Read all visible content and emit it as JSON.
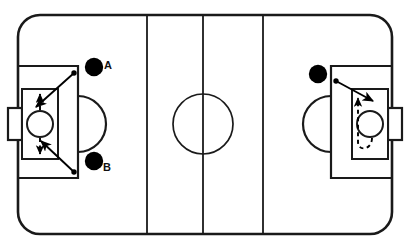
{
  "diagram": {
    "type": "ice-hockey-rink-play-diagram",
    "colors": {
      "ice": "#ffffff",
      "lines": "#1a1a1a",
      "player_fill": "#000000",
      "arrow": "#000000"
    },
    "rink": {
      "left": 18,
      "top": 15,
      "width": 374,
      "height": 219,
      "corner_radius": 22,
      "border_width": 2.6
    },
    "lines": [
      {
        "name": "blue-line-left",
        "x": 147,
        "label": "blue line"
      },
      {
        "name": "center-line",
        "x": 203,
        "label": "center red line"
      },
      {
        "name": "blue-line-right",
        "x": 263,
        "label": "blue line"
      }
    ],
    "center_circle": {
      "cx": 203,
      "cy": 124,
      "r": 30
    },
    "zones": {
      "left": {
        "goal_line_x": 78,
        "box_left": 18,
        "box_top": 66,
        "box_bottom": 178,
        "crease_arc_radius": 28,
        "goalie_box": {
          "x": 22,
          "y": 89,
          "w": 36,
          "h": 70
        },
        "goalie_circle": {
          "cx": 40,
          "cy": 124,
          "r": 13
        },
        "net": {
          "x": 8,
          "y": 108,
          "w": 14,
          "h": 32
        }
      },
      "right": {
        "goal_line_x": 331,
        "box_right": 391,
        "box_top": 66,
        "box_bottom": 178,
        "crease_arc_radius": 28,
        "goalie_box": {
          "x": 352,
          "y": 89,
          "w": 36,
          "h": 70
        },
        "goalie_circle": {
          "cx": 370,
          "cy": 124,
          "r": 13
        },
        "net": {
          "x": 388,
          "y": 108,
          "w": 14,
          "h": 32
        }
      }
    },
    "players": [
      {
        "name": "player-a",
        "label": "A",
        "cx": 94,
        "cy": 67,
        "r": 9,
        "label_x": 104,
        "label_y": 60
      },
      {
        "name": "player-b",
        "label": "B",
        "cx": 94,
        "cy": 161,
        "r": 9,
        "label_x": 103,
        "label_y": 162
      },
      {
        "name": "player-right",
        "label": "",
        "cx": 318,
        "cy": 74,
        "r": 9
      }
    ],
    "pucks": [
      {
        "name": "puck-a",
        "cx": 74,
        "cy": 73,
        "r": 2.6
      },
      {
        "name": "puck-b",
        "cx": 74,
        "cy": 172,
        "r": 2.6
      },
      {
        "name": "puck-right",
        "cx": 336,
        "cy": 81,
        "r": 2.6
      }
    ],
    "shots": [
      {
        "name": "shot-a",
        "from": [
          74,
          73
        ],
        "to": [
          35,
          108
        ],
        "style": "solid",
        "arrow": true
      },
      {
        "name": "shot-b",
        "from": [
          74,
          172
        ],
        "to": [
          40,
          140
        ],
        "style": "solid",
        "arrow": true
      },
      {
        "name": "shot-right",
        "from": [
          336,
          81
        ],
        "to": [
          375,
          103
        ],
        "style": "solid",
        "arrow": true
      }
    ],
    "movements": [
      {
        "name": "goalie-move-up",
        "from": [
          40,
          111
        ],
        "to": [
          40,
          93
        ],
        "style": "dashed",
        "arrow": true,
        "direction": "up"
      },
      {
        "name": "goalie-move-down",
        "from": [
          40,
          137
        ],
        "to": [
          40,
          155
        ],
        "style": "dashed",
        "arrow": true,
        "direction": "down"
      },
      {
        "name": "goalie-loop-right",
        "style": "dashed",
        "arrow": true,
        "direction": "up",
        "description": "loop under crease then up"
      }
    ],
    "labels": {
      "a": "A",
      "b": "B"
    }
  }
}
